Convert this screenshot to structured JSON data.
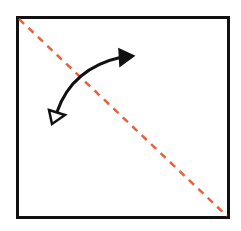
{
  "diagram": {
    "square": {
      "x": 17,
      "y": 17,
      "width": 212,
      "height": 201,
      "stroke": "#111111",
      "stroke_width": 3
    },
    "fold_line": {
      "x1": 18,
      "y1": 18,
      "x2": 228,
      "y2": 217,
      "color": "#e8603c",
      "style": "dashed"
    },
    "fold_arrow": {
      "color": "#111111",
      "start_head": "hollow-triangle",
      "end_head": "filled-triangle",
      "start": [
        52,
        123
      ],
      "end": [
        133,
        56
      ]
    }
  }
}
